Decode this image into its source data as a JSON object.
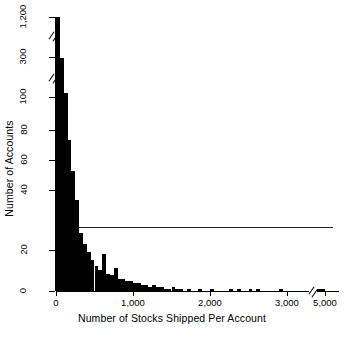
{
  "chart_data": {
    "type": "bar",
    "title": "",
    "subtitle": "",
    "xlabel": "Number of Stocks Shipped Per Account",
    "ylabel": "Number of Accounts",
    "grid": false,
    "legend": null,
    "xlim": [
      0,
      5000
    ],
    "ylim": [
      0,
      1200
    ],
    "y_axis_breaks": [
      {
        "between": [
          100,
          300
        ],
        "label": "break-1"
      },
      {
        "between": [
          300,
          1200
        ],
        "label": "break-2"
      }
    ],
    "x_axis_breaks": [
      {
        "between": [
          3000,
          5000
        ],
        "label": "x-break-1"
      }
    ],
    "ytick_labels": [
      "0",
      "20",
      "40",
      "60",
      "80",
      "100",
      "300",
      "1,200"
    ],
    "ytick_values": [
      0,
      20,
      40,
      60,
      80,
      100,
      300,
      1200
    ],
    "xtick_labels": [
      "0",
      "1,000",
      "2,000",
      "3,000",
      "5,000"
    ],
    "xtick_values": [
      0,
      1000,
      2000,
      3000,
      5000
    ],
    "reference_line": {
      "y_value": 33,
      "orientation": "horizontal",
      "label": ""
    },
    "bin_width": 50,
    "categories": [
      "0-50",
      "50-100",
      "100-150",
      "150-200",
      "200-250",
      "250-300",
      "300-350",
      "350-400",
      "400-450",
      "450-500",
      "500-550",
      "550-600",
      "600-650",
      "650-700",
      "700-750",
      "750-800",
      "800-850",
      "850-900",
      "900-950",
      "950-1000",
      "1000-1050",
      "1050-1100",
      "1100-1150",
      "1150-1200",
      "1200-1250",
      "1250-1300",
      "1300-1350",
      "1350-1400",
      "1400-1450",
      "1450-1500",
      "1500-1550",
      "1550-1600",
      "1600-1650",
      "1650-1700",
      "1700-1750",
      "1750-1800",
      "1800-1850",
      "1850-1900",
      "1900-1950",
      "1950-2000",
      "2000-2050",
      "2050-2100",
      "2100-2150",
      "2150-2200",
      "2200-2250",
      "2250-2300",
      "2300-2350",
      "2350-2400",
      "2400-2450",
      "2450-2500",
      "2500-2550",
      "2550-2600",
      "2600-2650",
      "2650-2700",
      "2700-2750",
      "2750-2800",
      "2800-2850",
      "2850-2900",
      "2900-2950",
      "2950-3000",
      "4950-5000"
    ],
    "values": [
      1200,
      295,
      120,
      78,
      62,
      47,
      30,
      24,
      20,
      16,
      13,
      11,
      19,
      9,
      8,
      12,
      6,
      6,
      5,
      5,
      4,
      4,
      3,
      3,
      2,
      3,
      2,
      2,
      1,
      1,
      2,
      1,
      1,
      0,
      1,
      0,
      0,
      1,
      0,
      0,
      1,
      0,
      0,
      0,
      0,
      1,
      0,
      1,
      0,
      0,
      1,
      0,
      1,
      0,
      0,
      0,
      0,
      0,
      1,
      0,
      1
    ],
    "bar_color": "#000000"
  },
  "axis": {
    "y_title": "Number of Accounts",
    "x_title": "Number of Stocks Shipped Per Account",
    "yticks": [
      {
        "label": "1,200",
        "top": 17
      },
      {
        "label": "300",
        "top": 57
      },
      {
        "label": "100",
        "top": 97
      },
      {
        "label": "80",
        "top": 130
      },
      {
        "label": "60",
        "top": 160
      },
      {
        "label": "40",
        "top": 190
      },
      {
        "label": "20",
        "top": 250
      },
      {
        "label": "0",
        "top": 291
      }
    ],
    "xticks": [
      {
        "label": "0",
        "left": 56
      },
      {
        "label": "1,000",
        "left": 133
      },
      {
        "label": "2,000",
        "left": 210
      },
      {
        "label": "3,000",
        "left": 287
      },
      {
        "label": "5,000",
        "left": 325
      }
    ]
  }
}
